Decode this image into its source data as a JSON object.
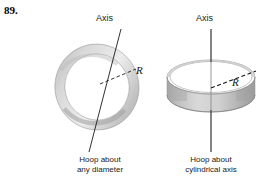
{
  "figure": {
    "problem_number": "89.",
    "background_color": "#ffffff",
    "ink_color": "#1a1a1a",
    "hoop_fill_light": "#f4f4f4",
    "hoop_fill_mid": "#c9c9c9",
    "hoop_fill_dark": "#9a9a9a"
  },
  "left_panel": {
    "axis_label": "Axis",
    "radius_label": "R",
    "caption_line1": "Hoop about",
    "caption_line2": "any diameter",
    "axis_orientation": "tilted-diameter"
  },
  "right_panel": {
    "axis_label": "Axis",
    "radius_label": "R",
    "caption_line1": "Hoop about",
    "caption_line2": "cylindrical axis",
    "axis_orientation": "vertical-cylindrical"
  }
}
